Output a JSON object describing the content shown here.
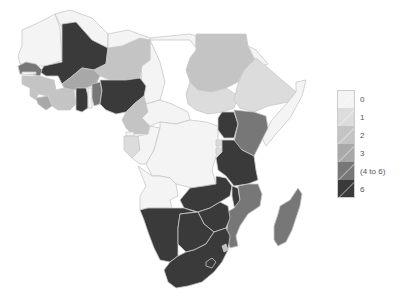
{
  "map": {
    "title": "",
    "region": "Africa",
    "countries": [
      {
        "name": "Morocco",
        "value_class": "0",
        "color": "#f4f4f4"
      },
      {
        "name": "Western Sahara",
        "value_class": "0",
        "color": "#f4f4f4"
      },
      {
        "name": "Mauritania",
        "value_class": "0",
        "color": "#f4f4f4"
      },
      {
        "name": "Mali",
        "value_class": "6",
        "color": "#3a3a3a"
      },
      {
        "name": "Niger",
        "value_class": "2",
        "color": "#c4c4c4"
      },
      {
        "name": "Algeria",
        "value_class": "0",
        "color": "#f4f4f4"
      },
      {
        "name": "Libya",
        "value_class": "0",
        "color": "#f4f4f4"
      },
      {
        "name": "Egypt",
        "value_class": "0",
        "color": "#f4f4f4"
      },
      {
        "name": "Chad",
        "value_class": "0",
        "color": "#f4f4f4"
      },
      {
        "name": "Sudan",
        "value_class": "2",
        "color": "#c4c4c4"
      },
      {
        "name": "South Sudan",
        "value_class": "1",
        "color": "#dcdcdc"
      },
      {
        "name": "Eritrea",
        "value_class": "0",
        "color": "#f4f4f4"
      },
      {
        "name": "Ethiopia",
        "value_class": "1",
        "color": "#dcdcdc"
      },
      {
        "name": "Somalia",
        "value_class": "0",
        "color": "#f4f4f4"
      },
      {
        "name": "Senegal",
        "value_class": "4 to 6",
        "color": "#777777"
      },
      {
        "name": "Gambia",
        "value_class": "0",
        "color": "#f4f4f4"
      },
      {
        "name": "Guinea-Bissau",
        "value_class": "2",
        "color": "#c4c4c4"
      },
      {
        "name": "Guinea",
        "value_class": "2",
        "color": "#c4c4c4"
      },
      {
        "name": "Sierra Leone",
        "value_class": "2",
        "color": "#c4c4c4"
      },
      {
        "name": "Liberia",
        "value_class": "3",
        "color": "#a8a8a8"
      },
      {
        "name": "Cote d'Ivoire",
        "value_class": "2",
        "color": "#c4c4c4"
      },
      {
        "name": "Burkina Faso",
        "value_class": "3",
        "color": "#a8a8a8"
      },
      {
        "name": "Ghana",
        "value_class": "6",
        "color": "#3a3a3a"
      },
      {
        "name": "Togo",
        "value_class": "0",
        "color": "#f4f4f4"
      },
      {
        "name": "Benin",
        "value_class": "4 to 6",
        "color": "#777777"
      },
      {
        "name": "Nigeria",
        "value_class": "6",
        "color": "#3a3a3a"
      },
      {
        "name": "Cameroon",
        "value_class": "2",
        "color": "#c4c4c4"
      },
      {
        "name": "Central African Republic",
        "value_class": "0",
        "color": "#f4f4f4"
      },
      {
        "name": "Equatorial Guinea",
        "value_class": "0",
        "color": "#f4f4f4"
      },
      {
        "name": "Gabon",
        "value_class": "1",
        "color": "#dcdcdc"
      },
      {
        "name": "Congo",
        "value_class": "0",
        "color": "#f4f4f4"
      },
      {
        "name": "DR Congo",
        "value_class": "0",
        "color": "#f4f4f4"
      },
      {
        "name": "Uganda",
        "value_class": "6",
        "color": "#3a3a3a"
      },
      {
        "name": "Kenya",
        "value_class": "4 to 6",
        "color": "#777777"
      },
      {
        "name": "Rwanda",
        "value_class": "1",
        "color": "#dcdcdc"
      },
      {
        "name": "Burundi",
        "value_class": "1",
        "color": "#dcdcdc"
      },
      {
        "name": "Tanzania",
        "value_class": "6",
        "color": "#3a3a3a"
      },
      {
        "name": "Angola",
        "value_class": "0",
        "color": "#f4f4f4"
      },
      {
        "name": "Zambia",
        "value_class": "6",
        "color": "#3a3a3a"
      },
      {
        "name": "Malawi",
        "value_class": "6",
        "color": "#3a3a3a"
      },
      {
        "name": "Mozambique",
        "value_class": "4 to 6",
        "color": "#777777"
      },
      {
        "name": "Zimbabwe",
        "value_class": "6",
        "color": "#3a3a3a"
      },
      {
        "name": "Namibia",
        "value_class": "6",
        "color": "#3a3a3a"
      },
      {
        "name": "Botswana",
        "value_class": "6",
        "color": "#3a3a3a"
      },
      {
        "name": "South Africa",
        "value_class": "6",
        "color": "#3a3a3a"
      },
      {
        "name": "Swaziland",
        "value_class": "2",
        "color": "#c4c4c4"
      },
      {
        "name": "Lesotho",
        "value_class": "6",
        "color": "#3a3a3a"
      },
      {
        "name": "Madagascar",
        "value_class": "4 to 6",
        "color": "#777777"
      }
    ]
  },
  "legend": {
    "items": [
      {
        "label": "0",
        "color": "#f4f4f4"
      },
      {
        "label": "1",
        "color": "#dcdcdc"
      },
      {
        "label": "2",
        "color": "#c4c4c4"
      },
      {
        "label": "3",
        "color": "#a8a8a8"
      },
      {
        "label": "(4 to 6)",
        "color": "#777777"
      },
      {
        "label": "6",
        "color": "#3a3a3a"
      }
    ]
  },
  "colors": {
    "c0": "#f4f4f4",
    "c1": "#dcdcdc",
    "c2": "#c4c4c4",
    "c3": "#a8a8a8",
    "c4": "#777777",
    "c6": "#3a3a3a",
    "border": "#c8c8c8"
  }
}
